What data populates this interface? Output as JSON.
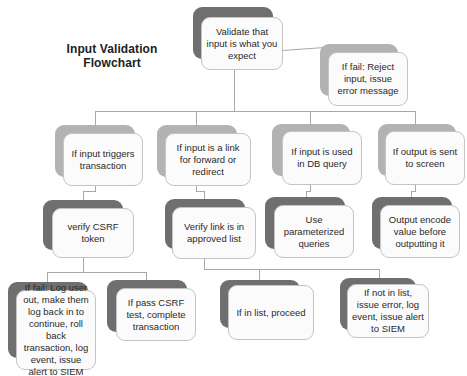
{
  "title": [
    "Input Validation",
    "Flowchart"
  ],
  "nodes": {
    "root": "Validate that input is what you expect",
    "reject": "If fail: Reject input, issue error message",
    "transaction": "If input triggers transaction",
    "redirect": "If input is a link for forward or redirect",
    "db_query": "If input is used in DB query",
    "screen_output": "If output is sent to screen",
    "verify_csrf": "verify CSRF token",
    "verify_link": "Verify link is in approved list",
    "parameterized": "Use parameterized queries",
    "output_encode": "Output encode value before outputting it",
    "csrf_fail": "If fail: Log user out, make them log back in to continue, roll back transaction, log event, issue alert to SIEM",
    "csrf_pass": "If pass CSRF test, complete transaction",
    "in_list": "If in list, proceed",
    "not_in_list": "If not in list, issue error, log event, issue alert to SIEM"
  },
  "colors": {
    "shadow_dark": "#6f6f6f",
    "shadow_light": "#b3b3b3",
    "box_fill": "#fbfbfb",
    "connector": "#a8a8a8"
  }
}
